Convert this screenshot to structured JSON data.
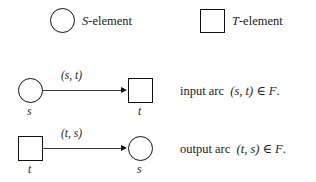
{
  "figure": {
    "type": "petri-net-notation-legend",
    "background_color": "#ffffff",
    "stroke_color": "#111111"
  },
  "legend": {
    "items": [
      {
        "shape": "circle",
        "shape_icon": "circle-shape-icon",
        "symbol": "S",
        "suffix": "-element",
        "full_label": "S-element"
      },
      {
        "shape": "square",
        "shape_icon": "square-shape-icon",
        "symbol": "T",
        "suffix": "-element",
        "full_label": "T-element"
      }
    ]
  },
  "rows": [
    {
      "id": "input-arc",
      "source": {
        "shape": "circle",
        "label": "s"
      },
      "target": {
        "shape": "square",
        "label": "t"
      },
      "arc_label": "(s, t)",
      "arrow_icon": "arrowhead-right-icon",
      "description": {
        "kind": "input arc",
        "pair": "(s, t)",
        "operator": "∈",
        "set": "F",
        "period": ".",
        "full_text": "input arc  (s, t) ∈ F."
      }
    },
    {
      "id": "output-arc",
      "source": {
        "shape": "square",
        "label": "t"
      },
      "target": {
        "shape": "circle",
        "label": "s"
      },
      "arc_label": "(t, s)",
      "arrow_icon": "arrowhead-right-icon",
      "description": {
        "kind": "output arc",
        "pair": "(t, s)",
        "operator": "∈",
        "set": "F",
        "period": ".",
        "full_text": "output arc  (t, s) ∈ F."
      }
    }
  ]
}
